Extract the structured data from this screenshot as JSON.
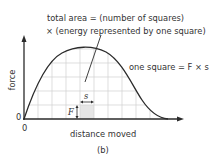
{
  "diagram": {
    "caption": "(b)",
    "y_axis_label": "force",
    "x_axis_label": "distance moved",
    "y_origin_label": "0",
    "x_origin_label": "0",
    "annotation_total_line1": "total area = (number of squares)",
    "annotation_total_line2": "× (energy represented by one square)",
    "annotation_square": "one square = F × s",
    "square_height_label": "F",
    "square_width_label": "s",
    "colors": {
      "line": "#2a2a2a",
      "grid": "#d0d0d0",
      "shaded_square": "#e6e6e6",
      "background": "#ffffff"
    }
  }
}
